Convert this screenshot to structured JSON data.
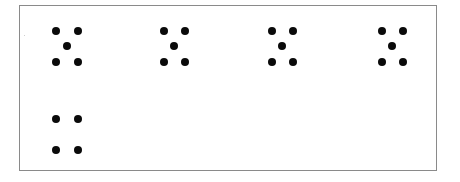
{
  "figure": {
    "colors": {
      "dot": "#0a0a0a",
      "border": "#8a8a8a",
      "background": "#ffffff"
    },
    "groups": [
      {
        "count": 5,
        "pattern": "quincunx",
        "dots": [
          [
            56,
            31
          ],
          [
            78,
            31
          ],
          [
            67,
            46
          ],
          [
            56,
            62
          ],
          [
            78,
            62
          ]
        ]
      },
      {
        "count": 5,
        "pattern": "quincunx",
        "dots": [
          [
            164,
            31
          ],
          [
            185,
            31
          ],
          [
            174,
            46
          ],
          [
            164,
            62
          ],
          [
            185,
            62
          ]
        ]
      },
      {
        "count": 5,
        "pattern": "quincunx",
        "dots": [
          [
            272,
            31
          ],
          [
            293,
            31
          ],
          [
            282,
            46
          ],
          [
            272,
            62
          ],
          [
            293,
            62
          ]
        ]
      },
      {
        "count": 5,
        "pattern": "quincunx",
        "dots": [
          [
            382,
            31
          ],
          [
            403,
            31
          ],
          [
            392,
            46
          ],
          [
            382,
            62
          ],
          [
            403,
            62
          ]
        ]
      },
      {
        "count": 4,
        "pattern": "square",
        "dots": [
          [
            56,
            119
          ],
          [
            78,
            119
          ],
          [
            56,
            150
          ],
          [
            78,
            150
          ]
        ]
      }
    ]
  }
}
